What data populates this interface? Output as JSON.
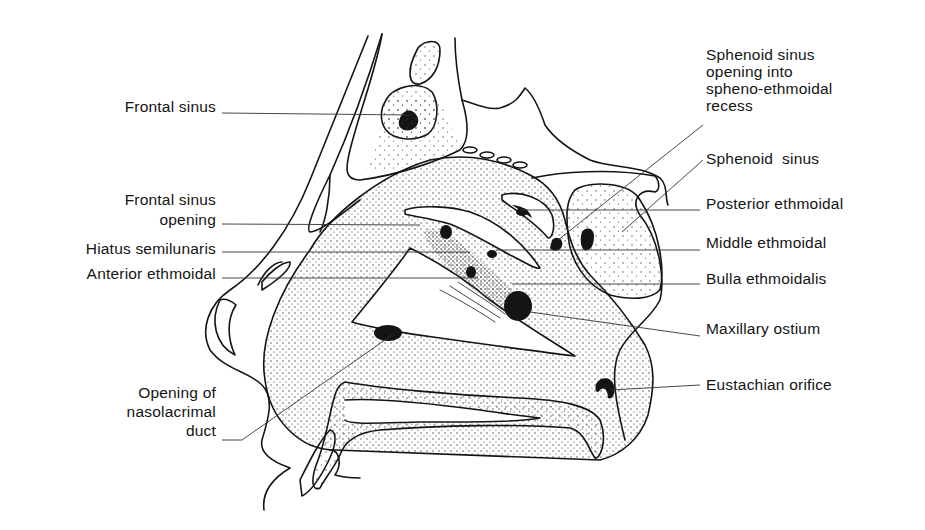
{
  "figure": {
    "colors": {
      "ink": "#141414",
      "background": "#ffffff",
      "stipple": "#3a3a3a"
    }
  },
  "labels_left": [
    {
      "id": "frontal-sinus",
      "lines": [
        "Frontal sinus"
      ]
    },
    {
      "id": "frontal-sinus-opening",
      "lines": [
        "Frontal sinus",
        "opening"
      ]
    },
    {
      "id": "hiatus-semilunaris",
      "lines": [
        "Hiatus semilunaris"
      ]
    },
    {
      "id": "anterior-ethmoidal",
      "lines": [
        "Anterior ethmoidal"
      ]
    },
    {
      "id": "nasolacrimal-duct-opening",
      "lines": [
        "Opening of",
        "nasolacrimal",
        "duct"
      ]
    }
  ],
  "labels_right": [
    {
      "id": "sphenoid-sinus-opening",
      "lines": [
        "Sphenoid sinus",
        "opening into",
        "spheno-ethmoidal",
        "recess"
      ]
    },
    {
      "id": "sphenoid-sinus",
      "lines": [
        "Sphenoid  sinus"
      ]
    },
    {
      "id": "posterior-ethmoidal",
      "lines": [
        "Posterior ethmoidal"
      ]
    },
    {
      "id": "middle-ethmoidal",
      "lines": [
        "Middle ethmoidal"
      ]
    },
    {
      "id": "bulla-ethmoidalis",
      "lines": [
        "Bulla ethmoidalis"
      ]
    },
    {
      "id": "maxillary-ostium",
      "lines": [
        "Maxillary ostium"
      ]
    },
    {
      "id": "eustachian-orifice",
      "lines": [
        "Eustachian orifice"
      ]
    }
  ]
}
